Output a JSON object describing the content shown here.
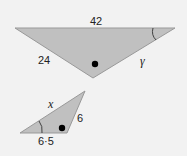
{
  "colors": {
    "background": "#f2f2f2",
    "triangle_fill": "#c0c0c0",
    "triangle_stroke": "#999999",
    "marker": "#000000",
    "text": "#222222"
  },
  "large_triangle": {
    "side_top": "42",
    "side_left": "24",
    "side_right_variable": "γ",
    "angle_marker": "arc at right vertex"
  },
  "small_triangle": {
    "side_hypotenuse_variable": "x",
    "side_right": "6",
    "side_bottom": "6·5",
    "angle_marker": "arc at left vertex"
  }
}
